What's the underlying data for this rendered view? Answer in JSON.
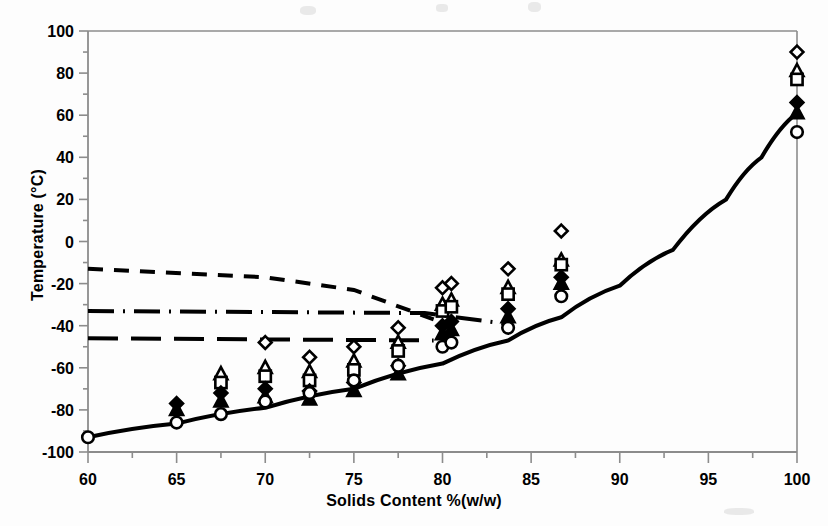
{
  "figure": {
    "background": "#fdfdfd",
    "ink_color": "#000000",
    "frame_color": "#8c8c8c"
  },
  "axes": {
    "x_title": "Solids Content %(w/w)",
    "y_title": "Temperature (°C)",
    "x_ticks": [
      "60",
      "65",
      "70",
      "75",
      "80",
      "85",
      "90",
      "95",
      "100"
    ],
    "y_ticks": [
      "100",
      "80",
      "60",
      "40",
      "20",
      "0",
      "-20",
      "-40",
      "-60",
      "-80",
      "-100"
    ]
  },
  "chart_data": {
    "type": "scatter",
    "title": "",
    "xlabel": "Solids Content %(w/w)",
    "ylabel": "Temperature (°C)",
    "xlim": [
      60,
      100
    ],
    "ylim": [
      -100,
      100
    ],
    "x_major_step": 5,
    "y_major_step": 20,
    "x_minor_step": 2.5,
    "y_minor_step": 10,
    "grid": false,
    "legend": "none",
    "series": [
      {
        "name": "open-diamond",
        "marker": "diamond-open",
        "points": [
          [
            70.0,
            -48
          ],
          [
            72.5,
            -55
          ],
          [
            75.0,
            -50
          ],
          [
            77.5,
            -41
          ],
          [
            80.0,
            -22
          ],
          [
            80.5,
            -20
          ],
          [
            83.7,
            -13
          ],
          [
            86.7,
            5
          ],
          [
            100.0,
            90
          ]
        ]
      },
      {
        "name": "open-triangle",
        "marker": "triangle-open",
        "points": [
          [
            67.5,
            -63
          ],
          [
            70.0,
            -60
          ],
          [
            72.5,
            -62
          ],
          [
            75.0,
            -57
          ],
          [
            77.5,
            -48
          ],
          [
            80.0,
            -30
          ],
          [
            80.5,
            -28
          ],
          [
            83.7,
            -22
          ],
          [
            86.7,
            -9
          ],
          [
            100.0,
            81
          ]
        ]
      },
      {
        "name": "open-square",
        "marker": "square-open",
        "points": [
          [
            67.5,
            -67
          ],
          [
            70.0,
            -64
          ],
          [
            72.5,
            -66
          ],
          [
            75.0,
            -61
          ],
          [
            77.5,
            -52
          ],
          [
            80.0,
            -33
          ],
          [
            80.5,
            -31
          ],
          [
            83.7,
            -25
          ],
          [
            86.7,
            -11
          ],
          [
            100.0,
            77
          ]
        ]
      },
      {
        "name": "filled-diamond",
        "marker": "diamond-filled",
        "points": [
          [
            65.0,
            -77
          ],
          [
            67.5,
            -72
          ],
          [
            70.0,
            -70
          ],
          [
            72.5,
            -71
          ],
          [
            75.0,
            -67
          ],
          [
            77.5,
            -59
          ],
          [
            80.0,
            -40
          ],
          [
            80.5,
            -38
          ],
          [
            83.7,
            -32
          ],
          [
            86.7,
            -17
          ],
          [
            100.0,
            66
          ]
        ]
      },
      {
        "name": "filled-triangle",
        "marker": "triangle-filled",
        "points": [
          [
            65.0,
            -80
          ],
          [
            67.5,
            -76
          ],
          [
            70.0,
            -74
          ],
          [
            72.5,
            -75
          ],
          [
            75.0,
            -71
          ],
          [
            77.5,
            -63
          ],
          [
            80.0,
            -44
          ],
          [
            80.5,
            -42
          ],
          [
            83.7,
            -36
          ],
          [
            86.7,
            -20
          ],
          [
            100.0,
            61
          ]
        ]
      },
      {
        "name": "open-circle",
        "marker": "circle-open",
        "points": [
          [
            60.0,
            -93
          ],
          [
            65.0,
            -86
          ],
          [
            67.5,
            -82
          ],
          [
            70.0,
            -76
          ],
          [
            72.5,
            -72
          ],
          [
            75.0,
            -66
          ],
          [
            77.5,
            -59
          ],
          [
            80.0,
            -50
          ],
          [
            80.5,
            -48
          ],
          [
            83.7,
            -41
          ],
          [
            86.7,
            -26
          ],
          [
            100.0,
            52
          ]
        ]
      }
    ],
    "curves": [
      {
        "name": "solid-glass-transition-curve",
        "style": "solid",
        "width": 4,
        "points": [
          [
            60,
            -93
          ],
          [
            65,
            -86.5
          ],
          [
            70,
            -79
          ],
          [
            75,
            -70
          ],
          [
            80,
            -58
          ],
          [
            83.7,
            -47
          ],
          [
            86.7,
            -36
          ],
          [
            90,
            -21
          ],
          [
            93,
            -4
          ],
          [
            96,
            20
          ],
          [
            98,
            40
          ],
          [
            100,
            61
          ]
        ]
      },
      {
        "name": "short-dashed-line",
        "style": "dashed",
        "width": 4,
        "points": [
          [
            60,
            -13
          ],
          [
            70,
            -17
          ],
          [
            75,
            -23
          ],
          [
            79.5,
            -37
          ]
        ]
      },
      {
        "name": "dash-dot-line",
        "style": "dash-dot",
        "width": 4,
        "points": [
          [
            60,
            -33
          ],
          [
            79.0,
            -34
          ],
          [
            83.5,
            -39
          ]
        ]
      },
      {
        "name": "long-dashed-line",
        "style": "long-dash",
        "width": 4,
        "points": [
          [
            60,
            -46
          ],
          [
            79.5,
            -47
          ]
        ]
      }
    ]
  }
}
